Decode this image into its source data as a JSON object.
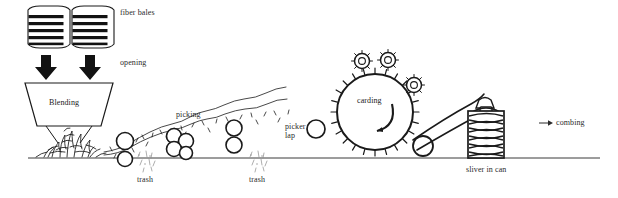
{
  "figure": {
    "background_color": "#ffffff",
    "ink_color": "#1a1a1a",
    "text_color": "#2b2b2b",
    "width": 618,
    "height": 198
  },
  "ground_line": {
    "name": "floor-line",
    "y": 158,
    "x_start": 28,
    "x_end": 600
  },
  "labels": {
    "fiber_bales": "fiber bales",
    "opening": "opening",
    "blending": "Blending",
    "picking": "picking",
    "trash_left": "trash",
    "trash_right": "trash",
    "picker_lap_line1": "picker",
    "picker_lap_line2": "lap",
    "carding": "carding",
    "sliver_in_can": "sliver in can",
    "combing": "combing",
    "combing_arrow": "→"
  },
  "stages": [
    {
      "id": "bales",
      "label": "fiber bales",
      "icon": "stacked-bale-icon",
      "count": 2,
      "straps_per_bale": 5
    },
    {
      "id": "opening",
      "label": "opening",
      "icon": "down-arrow-icon",
      "count": 2
    },
    {
      "id": "blending",
      "label": "Blending",
      "icon": "hopper-trapezoid-icon"
    },
    {
      "id": "picking",
      "label": "picking",
      "icon": "roller-train-icon",
      "roller_count": 9
    },
    {
      "id": "trash",
      "label": "trash",
      "icon": "debris-specks-icon",
      "occurrences": 2
    },
    {
      "id": "picker-lap",
      "label": "picker lap",
      "icon": "lap-roller-icon"
    },
    {
      "id": "carding",
      "label": "carding",
      "icon": "toothed-cylinder-icon",
      "flat_roller_count": 3,
      "rotation": "counterclockwise"
    },
    {
      "id": "sliver-can",
      "label": "sliver in can",
      "icon": "coiler-can-icon",
      "coil_layers": 11
    },
    {
      "id": "combing",
      "label": "combing",
      "icon": "arrow-right-icon"
    }
  ]
}
